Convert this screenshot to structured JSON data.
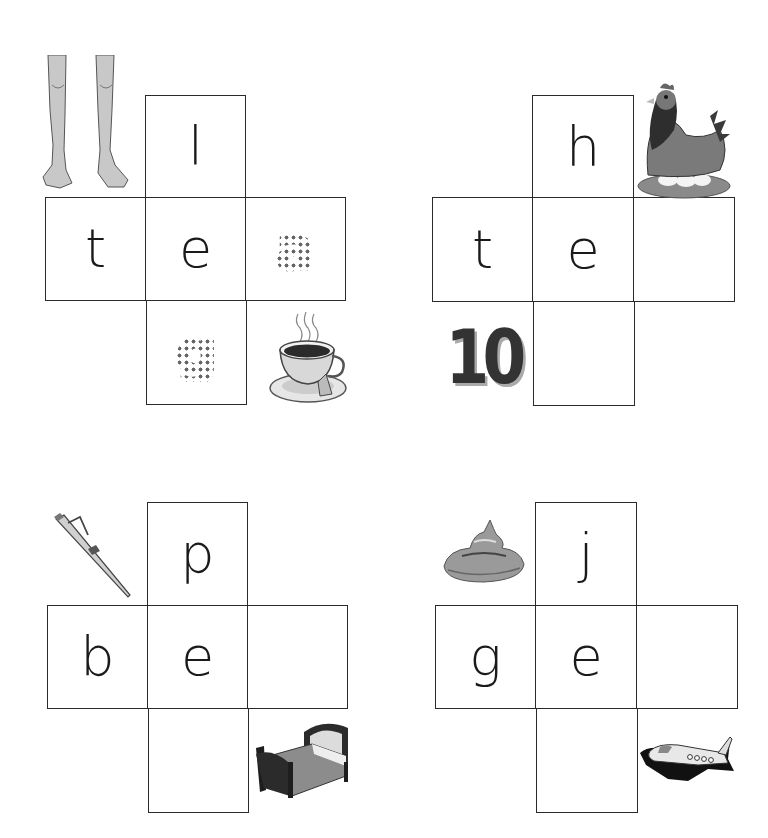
{
  "worksheet": {
    "puzzles": [
      {
        "id": "puzzle-1",
        "top": {
          "letter": "l",
          "style": "solid"
        },
        "left": {
          "letter": "t",
          "style": "solid"
        },
        "center": {
          "letter": "e",
          "style": "solid"
        },
        "right": {
          "letter": "a",
          "style": "dotted"
        },
        "bottom": {
          "letter": "g",
          "style": "dotted"
        },
        "pictures": [
          "legs",
          "tea-cup"
        ]
      },
      {
        "id": "puzzle-2",
        "top": {
          "letter": "h",
          "style": "solid"
        },
        "left": {
          "letter": "t",
          "style": "solid"
        },
        "center": {
          "letter": "e",
          "style": "solid"
        },
        "right": {
          "letter": "",
          "style": "blank"
        },
        "bottom": {
          "letter": "",
          "style": "blank"
        },
        "pictures": [
          "hen",
          "ten"
        ],
        "number_picture": "10"
      },
      {
        "id": "puzzle-3",
        "top": {
          "letter": "p",
          "style": "solid"
        },
        "left": {
          "letter": "b",
          "style": "solid"
        },
        "center": {
          "letter": "e",
          "style": "solid"
        },
        "right": {
          "letter": "",
          "style": "blank"
        },
        "bottom": {
          "letter": "",
          "style": "blank"
        },
        "pictures": [
          "pen",
          "bed"
        ]
      },
      {
        "id": "puzzle-4",
        "top": {
          "letter": "j",
          "style": "solid"
        },
        "left": {
          "letter": "g",
          "style": "solid"
        },
        "center": {
          "letter": "e",
          "style": "solid"
        },
        "right": {
          "letter": "",
          "style": "blank"
        },
        "bottom": {
          "letter": "",
          "style": "blank"
        },
        "pictures": [
          "gel",
          "jet"
        ]
      }
    ]
  }
}
